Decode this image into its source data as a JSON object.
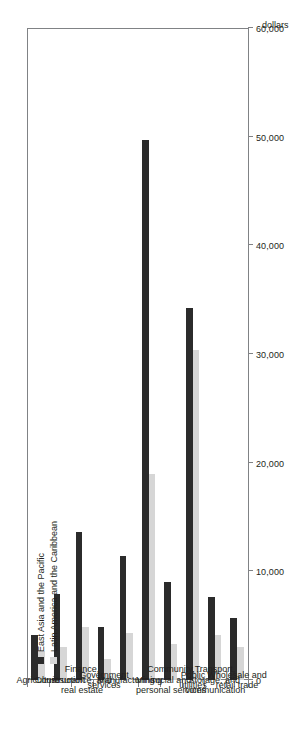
{
  "chart_data": {
    "type": "bar",
    "orientation": "horizontal-rotated",
    "title": "",
    "xlabel": "dollars",
    "ylabel": "",
    "axis_title": "dollars",
    "categories": [
      "Agriculture",
      "Construction",
      "Finance,\ninsurance, and\nreal estate",
      "Government\nservices",
      "Manufacturing",
      "Mining",
      "Community,\nsocial and\npersonal services",
      "Public\nutilities",
      "Transport,\nstorage, and\ncommunication",
      "Wholesale and\nretail trade"
    ],
    "tick_labels": [
      "0",
      "10,000",
      "20,000",
      "30,000",
      "40,000",
      "50,000",
      "60,000"
    ],
    "tick_values": [
      0,
      10000,
      20000,
      30000,
      40000,
      50000,
      60000
    ],
    "ylim": [
      0,
      60000
    ],
    "grid": false,
    "legend_position": "inside-upper-left",
    "series": [
      {
        "name": "East Asia and the Pacific",
        "color": "#2b2b2b",
        "values": [
          4100,
          7900,
          13600,
          4900,
          11400,
          49700,
          9000,
          34200,
          7600,
          5700
        ]
      },
      {
        "name": "Latin America and the Caribbean",
        "color": "#d6d6d6",
        "values": [
          2700,
          3000,
          4900,
          1900,
          4300,
          19000,
          3300,
          30400,
          4100,
          3000
        ]
      }
    ]
  }
}
